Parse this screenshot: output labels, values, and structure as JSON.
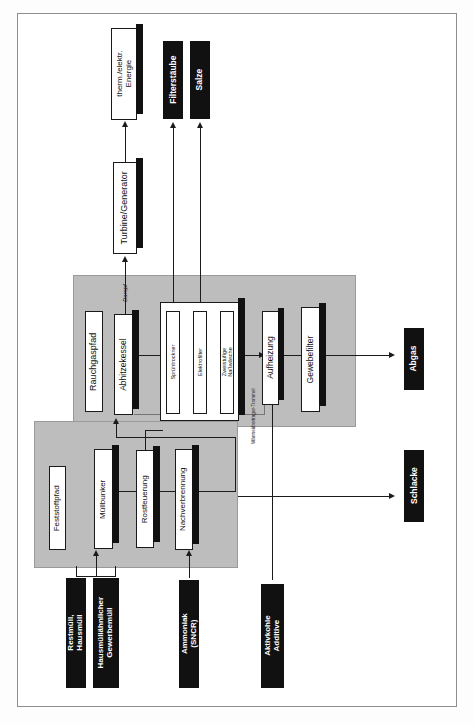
{
  "diagram": {
    "orientation": "rotated-90-ccw",
    "colors": {
      "zone_fill": "#bdbdbd",
      "box_white": "#ffffff",
      "box_black": "#111111",
      "line": "#1b1b1b",
      "page": "#ffffff"
    },
    "zones": [
      {
        "id": "rauchgas",
        "label": "Rauchgaspfad"
      },
      {
        "id": "feststoff",
        "label": "Feststoffpfad"
      }
    ],
    "inputs": [
      {
        "id": "restmuell",
        "label": "Restmüll, Hausmüll",
        "style": "black"
      },
      {
        "id": "gewerbe",
        "label": "Hausmüllähnlicher\nGewerbemüll",
        "style": "black"
      },
      {
        "id": "ammoniak",
        "label": "Ammoniak (SNCR)",
        "style": "black"
      },
      {
        "id": "aktivkohle",
        "label": "Aktivkohle\nAdditive",
        "style": "black"
      }
    ],
    "outputs": [
      {
        "id": "energie",
        "label": "therm./elektr.\nEnergie",
        "style": "white"
      },
      {
        "id": "filterstaube",
        "label": "Filterstäube",
        "style": "black"
      },
      {
        "id": "salze",
        "label": "Salze",
        "style": "black"
      },
      {
        "id": "abgas",
        "label": "Abgas",
        "style": "black"
      },
      {
        "id": "schlacke",
        "label": "Schlacke",
        "style": "black"
      }
    ],
    "units": [
      {
        "id": "turbine",
        "label": "Turbine/Generator",
        "path": "energie"
      },
      {
        "id": "abhitzekessel",
        "label": "Abhitzekessel",
        "path": "rauchgas"
      },
      {
        "id": "spruehtrockner",
        "label": "Sprühtrockner",
        "path": "rauchgas"
      },
      {
        "id": "elektrofilter",
        "label": "Elektrofilter",
        "path": "rauchgas"
      },
      {
        "id": "nasswaesche",
        "label": "Zweistufige Naßwäsche",
        "path": "rauchgas"
      },
      {
        "id": "aufheizung",
        "label": "Aufheizung",
        "path": "rauchgas"
      },
      {
        "id": "gewebefilter",
        "label": "Gewebefilter",
        "path": "rauchgas"
      },
      {
        "id": "muellbunker",
        "label": "Müllbunker",
        "path": "feststoff"
      },
      {
        "id": "rostfeuerung",
        "label": "Rostfeuerung",
        "path": "feststoff"
      },
      {
        "id": "nachverbrennung",
        "label": "Nachverbrennung",
        "path": "feststoff"
      }
    ],
    "stream_labels": [
      {
        "id": "dampf",
        "label": "Dampf"
      },
      {
        "id": "trommel",
        "label": "Wärmeübertrager-Trommel"
      }
    ]
  }
}
